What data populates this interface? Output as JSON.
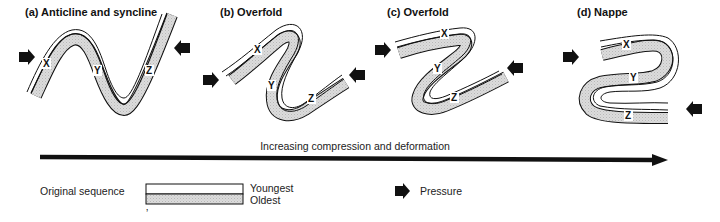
{
  "panels": [
    {
      "id": "a",
      "title": "(a)  Anticline and syncline",
      "labels": {
        "x": "X",
        "y": "Y",
        "z": "Z"
      }
    },
    {
      "id": "b",
      "title": "(b)  Overfold",
      "labels": {
        "x": "X",
        "y": "Y",
        "z": "Z"
      }
    },
    {
      "id": "c",
      "title": "(c)  Overfold",
      "labels": {
        "x": "X",
        "y": "Y",
        "z": "Z"
      }
    },
    {
      "id": "d",
      "title": "(d)  Nappe",
      "labels": {
        "x": "X",
        "y": "Y",
        "z": "Z"
      }
    }
  ],
  "progression": {
    "caption": "Increasing compression and deformation"
  },
  "legend": {
    "sequence_label": "Original sequence",
    "youngest_label": "Youngest",
    "oldest_label": "Oldest",
    "pressure_label": "Pressure",
    "stray_mark": "ʼ"
  },
  "colors": {
    "line": "#111111",
    "oldest_fill": "#d4d4d4",
    "youngest_fill": "#ffffff",
    "arrow": "#111111"
  }
}
